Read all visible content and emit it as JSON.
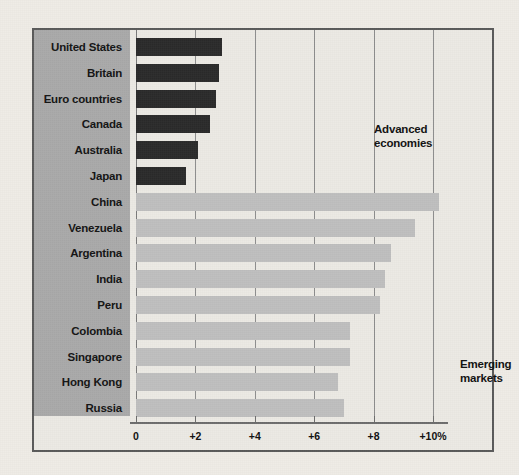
{
  "chart_data": {
    "type": "bar",
    "orientation": "horizontal",
    "title": "",
    "subtitle": "",
    "xlabel": "",
    "ylabel": "",
    "xlim": [
      0,
      12
    ],
    "grid": true,
    "grid_axis": "x",
    "legend_position": "inside-annotations",
    "tick_labels": [
      "0",
      "+2",
      "+4",
      "+6",
      "+8",
      "+10%"
    ],
    "tick_values": [
      0,
      2,
      4,
      6,
      8,
      10
    ],
    "annotations": [
      {
        "text": "Advanced\neconomies",
        "line1": "Advanced",
        "line2": "economies"
      },
      {
        "text": "Emerging\nmarkets",
        "line1": "Emerging",
        "line2": "markets"
      }
    ],
    "categories": [
      "United States",
      "Britain",
      "Euro countries",
      "Canada",
      "Australia",
      "Japan",
      "China",
      "Venezuela",
      "Argentina",
      "India",
      "Peru",
      "Colombia",
      "Singapore",
      "Hong Kong",
      "Russia"
    ],
    "values": [
      2.9,
      2.8,
      2.7,
      2.5,
      2.1,
      1.7,
      10.2,
      9.4,
      8.6,
      8.4,
      8.2,
      7.2,
      7.2,
      6.8,
      7.0
    ],
    "series": [
      {
        "name": "Advanced economies",
        "color": "#2b2b2b",
        "points": [
          {
            "label": "United States",
            "value": 2.9
          },
          {
            "label": "Britain",
            "value": 2.8
          },
          {
            "label": "Euro countries",
            "value": 2.7
          },
          {
            "label": "Canada",
            "value": 2.5
          },
          {
            "label": "Australia",
            "value": 2.1
          },
          {
            "label": "Japan",
            "value": 1.7
          }
        ]
      },
      {
        "name": "Emerging markets",
        "color": "#bfbfbf",
        "points": [
          {
            "label": "China",
            "value": 10.2
          },
          {
            "label": "Venezuela",
            "value": 9.4
          },
          {
            "label": "Argentina",
            "value": 8.6
          },
          {
            "label": "India",
            "value": 8.4
          },
          {
            "label": "Peru",
            "value": 8.2
          },
          {
            "label": "Colombia",
            "value": 7.2
          },
          {
            "label": "Singapore",
            "value": 7.2
          },
          {
            "label": "Hong Kong",
            "value": 6.8
          },
          {
            "label": "Russia",
            "value": 7.0
          }
        ]
      }
    ]
  },
  "colors": {
    "background": "#efece6",
    "panel": "#a9a9a9",
    "plot": "#eceae4",
    "bar_dark": "#2b2b2b",
    "bar_light": "#bfbfbf",
    "border": "#5a5a5a",
    "gridline": "#8d8d8d"
  }
}
